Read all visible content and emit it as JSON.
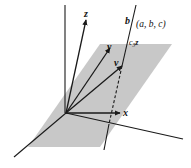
{
  "figure": {
    "type": "3D vector diagram",
    "plane_color": "#c8c8c8",
    "line_color": "#1a1a1a",
    "labels": {
      "z": "z",
      "y": "y",
      "v": "v",
      "x": "x",
      "b": "b",
      "point": "(a, b, c)",
      "c3z_c": "c",
      "c3z_sub": "3",
      "c3z_z": "z"
    }
  }
}
